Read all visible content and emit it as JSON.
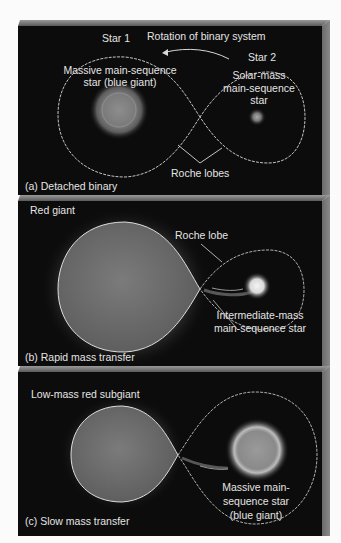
{
  "figure": {
    "colors": {
      "background": "#fbfbfb",
      "panel": "#0c0c0c",
      "text": "#e4e4e4",
      "lobe_line": "#d8d8d8",
      "bevel": "#8a8a8a"
    },
    "panels": [
      {
        "id": "a",
        "caption": "(a) Detached binary",
        "labels": {
          "star1": "Star 1",
          "rotation": "Rotation of binary system",
          "star2": "Star 2",
          "star1_desc_line1": "Massive main-sequence",
          "star1_desc_line2": "star (blue giant)",
          "star2_desc_line1": "Solar-mass",
          "star2_desc_line2": "main-sequence",
          "star2_desc_line3": "star",
          "roche": "Roche lobes"
        }
      },
      {
        "id": "b",
        "caption": "(b) Rapid mass transfer",
        "labels": {
          "giant": "Red giant",
          "roche": "Roche lobe",
          "companion_line1": "Intermediate-mass",
          "companion_line2": "main-sequence star"
        }
      },
      {
        "id": "c",
        "caption": "(c) Slow mass transfer",
        "labels": {
          "subgiant": "Low-mass red subgiant",
          "companion_line1": "Massive main-",
          "companion_line2": "sequence star",
          "companion_line3": "(blue giant)"
        }
      }
    ]
  }
}
